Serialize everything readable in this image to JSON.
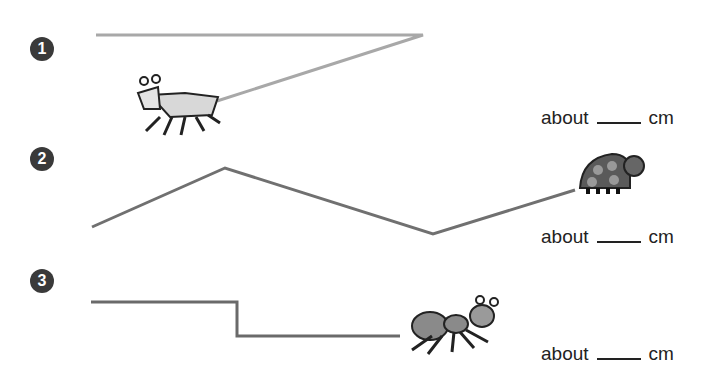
{
  "problems": [
    {
      "number": "1",
      "answer": {
        "prefix": "about",
        "unit": "cm"
      },
      "creature": "grasshopper",
      "path": [
        [
          96,
          35
        ],
        [
          423,
          35
        ],
        [
          217,
          101
        ]
      ],
      "color": "#a8a8a8"
    },
    {
      "number": "2",
      "answer": {
        "prefix": "about",
        "unit": "cm"
      },
      "creature": "ladybug",
      "path": [
        [
          92,
          227
        ],
        [
          225,
          168
        ],
        [
          433,
          234
        ],
        [
          575,
          190
        ]
      ],
      "color": "#707070"
    },
    {
      "number": "3",
      "answer": {
        "prefix": "about",
        "unit": "cm"
      },
      "creature": "ant",
      "path": [
        [
          91,
          302
        ],
        [
          237,
          302
        ],
        [
          237,
          336
        ],
        [
          400,
          336
        ]
      ],
      "color": "#6a6a6a"
    }
  ]
}
